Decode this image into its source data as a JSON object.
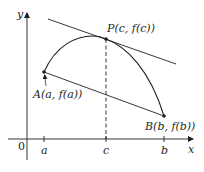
{
  "diagram": {
    "axes": {
      "x_label": "x",
      "y_label": "y",
      "origin_label": "0"
    },
    "ticks": {
      "a": "a",
      "c": "c",
      "b": "b"
    },
    "points": {
      "A": {
        "label": "A(a, f(a))"
      },
      "P": {
        "label": "P(c, f(c))"
      },
      "B": {
        "label": "B(b, f(b))"
      }
    },
    "colors": {
      "ink": "#231f20",
      "background": "#ffffff"
    }
  }
}
